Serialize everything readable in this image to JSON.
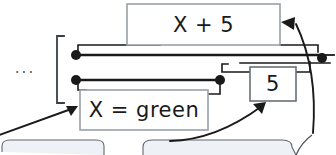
{
  "canvas": {
    "width": 336,
    "height": 155,
    "background": "#ffffff",
    "stroke": "#1a1a1a",
    "box_fill": "#ffffff",
    "box_border": "#9aa0a6",
    "wire_color": "#1a1a1a",
    "faint_fill": "#eef1f5"
  },
  "blocks": [
    {
      "id": "expression-block",
      "label": "X + 5",
      "x": 127,
      "y": 4,
      "width": 153,
      "height": 41
    },
    {
      "id": "assignment-block",
      "label": "X = green",
      "x": 80,
      "y": 90,
      "width": 128,
      "height": 40
    },
    {
      "id": "number-block",
      "label": "5",
      "x": 250,
      "y": 67,
      "width": 46,
      "height": 34
    }
  ],
  "annotations": {
    "ellipsis": "...",
    "bracket_name": "variable-group-bracket",
    "terminals": [
      {
        "id": "terminal-upper-left",
        "x": 76,
        "y": 55
      },
      {
        "id": "terminal-lower-left",
        "x": 76,
        "y": 80
      },
      {
        "id": "terminal-mid-right",
        "x": 220,
        "y": 80
      },
      {
        "id": "terminal-far-right",
        "x": 322,
        "y": 58
      }
    ],
    "callout_arrows": [
      {
        "id": "callout-arrow-to-assignment",
        "target": "X = green"
      },
      {
        "id": "callout-arrow-to-number",
        "target": "5"
      },
      {
        "id": "callout-arrow-to-expression",
        "target": "X + 5"
      }
    ]
  }
}
